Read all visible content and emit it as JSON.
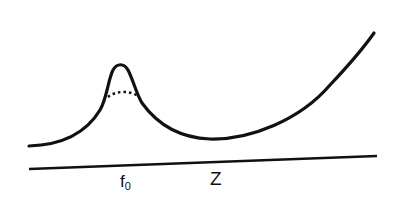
{
  "diagram": {
    "labels": {
      "f_main": "f",
      "f_sub": "0",
      "z": "Z"
    },
    "colors": {
      "stroke": "#111111",
      "background": "#ffffff"
    },
    "elements": {
      "curve": "solid curve: low left, sharp peak at f0, dip minimum, rising right",
      "dotted_arc": "dotted arc beneath the peak",
      "baseline": "slightly sloped horizontal axis line"
    }
  }
}
